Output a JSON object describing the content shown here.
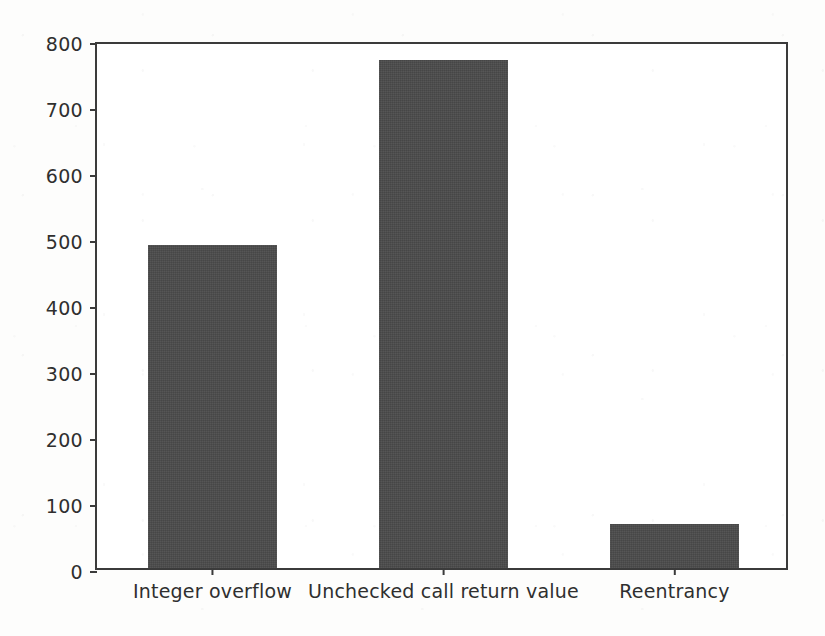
{
  "chart_data": {
    "type": "bar",
    "title": "",
    "subtitle": "",
    "xlabel": "",
    "ylabel": "",
    "categories": [
      "Integer overflow",
      "Unchecked call return value",
      "Reentrancy"
    ],
    "values": [
      490,
      770,
      66
    ],
    "series": [
      {
        "name": "Vulnerability count",
        "values": [
          490,
          770,
          66
        ]
      }
    ],
    "ylim": [
      0,
      800
    ],
    "yticks": [
      0,
      100,
      200,
      300,
      400,
      500,
      600,
      700,
      800
    ],
    "ytick_labels": [
      "0",
      "100",
      "200",
      "300",
      "400",
      "500",
      "600",
      "700",
      "800"
    ],
    "grid": false,
    "legend": null,
    "legend_position": "none",
    "annotations": [],
    "bar_color": "#4a4a4a",
    "axis_color": "#3b3b3b",
    "background_color": "#ffffff"
  },
  "figure": {
    "frame_visible": true,
    "tick_direction": "out"
  }
}
